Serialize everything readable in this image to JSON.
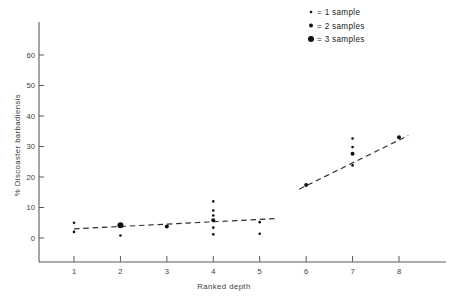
{
  "chart_data": {
    "type": "scatter",
    "title": "",
    "xlabel": "Ranked depth",
    "ylabel": "% Discoaster barbadiensis",
    "xlim": [
      0,
      8.8
    ],
    "ylim": [
      0,
      65
    ],
    "grid": false,
    "xticks": [
      1,
      2,
      3,
      4,
      5,
      6,
      7,
      8
    ],
    "xticklabels": [
      "1",
      "2",
      "3",
      "4",
      "5",
      "6",
      "7",
      "8"
    ],
    "yticks": [
      0,
      10,
      20,
      30,
      40,
      50,
      60
    ],
    "yticklabels": [
      "0",
      "10",
      "20",
      "30",
      "40",
      "50",
      "60"
    ],
    "marker_encoding": "dot size encodes number of samples at that point",
    "points": [
      {
        "x": 1,
        "y": 5.0,
        "samples": 1
      },
      {
        "x": 1,
        "y": 2.0,
        "samples": 1
      },
      {
        "x": 2,
        "y": 4.2,
        "samples": 3
      },
      {
        "x": 2,
        "y": 0.8,
        "samples": 1
      },
      {
        "x": 3,
        "y": 3.8,
        "samples": 2
      },
      {
        "x": 4,
        "y": 12.0,
        "samples": 1
      },
      {
        "x": 4,
        "y": 9.0,
        "samples": 1
      },
      {
        "x": 4,
        "y": 7.4,
        "samples": 1
      },
      {
        "x": 4,
        "y": 5.8,
        "samples": 2
      },
      {
        "x": 4,
        "y": 3.4,
        "samples": 1
      },
      {
        "x": 4,
        "y": 1.2,
        "samples": 1
      },
      {
        "x": 5,
        "y": 5.2,
        "samples": 1
      },
      {
        "x": 5,
        "y": 1.4,
        "samples": 1
      },
      {
        "x": 6,
        "y": 17.4,
        "samples": 2
      },
      {
        "x": 7,
        "y": 32.6,
        "samples": 1
      },
      {
        "x": 7,
        "y": 29.8,
        "samples": 1
      },
      {
        "x": 7,
        "y": 27.6,
        "samples": 2
      },
      {
        "x": 7,
        "y": 23.8,
        "samples": 1
      },
      {
        "x": 8,
        "y": 33.0,
        "samples": 2
      }
    ],
    "trendlines": [
      {
        "name": "shallow-segment",
        "x0": 1,
        "y0": 3.0,
        "x1": 5.4,
        "y1": 6.4,
        "style": "dashed"
      },
      {
        "name": "deep-segment",
        "x0": 5.85,
        "y0": 16.0,
        "x1": 8.2,
        "y1": 33.6,
        "style": "dashed"
      }
    ]
  },
  "legend": {
    "position": "top-right",
    "items": [
      {
        "label": "= 1 sample",
        "samples": 1,
        "dot_radius": 1.3
      },
      {
        "label": "= 2 samples",
        "samples": 2,
        "dot_radius": 2.0
      },
      {
        "label": "= 3 samples",
        "samples": 3,
        "dot_radius": 3.0
      }
    ]
  },
  "colors": {
    "marker": "#111111",
    "axis": "#5a5a5a",
    "text": "#3a3a3a",
    "background": "#ffffff"
  }
}
